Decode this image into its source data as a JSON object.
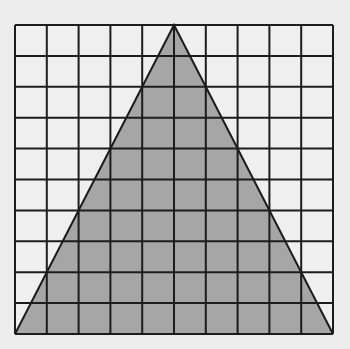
{
  "figure": {
    "type": "triangle-on-grid",
    "grid": {
      "columns": 10,
      "rows": 10
    },
    "triangle": {
      "vertices_grid_units": [
        [
          0,
          10
        ],
        [
          5,
          0
        ],
        [
          10,
          10
        ]
      ],
      "description": "Isosceles triangle with base spanning full grid bottom and apex at top-center"
    },
    "colors": {
      "background": "#ececec",
      "grid_cell": "#efefef",
      "triangle_fill": "#a6a6a6",
      "line": "#1c1c1c"
    }
  }
}
